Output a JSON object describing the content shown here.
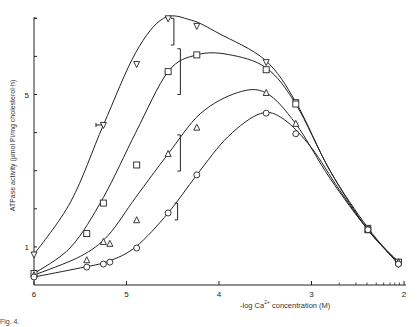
{
  "chart_data": {
    "type": "line",
    "title": "",
    "xlabel": "-log Ca2+ concentration (M)",
    "xlabel_parts": {
      "prefix": "-log Ca",
      "sup": "2+",
      "suffix": " concentration (M)"
    },
    "ylabel": "ATPase activity (µmol Pi/mg cholesterol·h)",
    "xlim": [
      6,
      2
    ],
    "ylim": [
      0,
      7.0
    ],
    "x_ticks": [
      6,
      5,
      4,
      3,
      2
    ],
    "x_tick_labels": [
      "6",
      "5",
      "4",
      "3",
      "2"
    ],
    "x_minor_ticks": [
      2.7,
      2.52,
      2.4,
      2.3,
      2.22,
      2.15,
      2.1,
      2.05
    ],
    "y_ticks": [
      1,
      2,
      3,
      4,
      5,
      6,
      7
    ],
    "y_tick_labels": {
      "1": "1",
      "5": "5"
    },
    "grid": false,
    "legend": null,
    "series": [
      {
        "name": "inverted-triangle",
        "marker": "triangle-down",
        "points": [
          [
            6.0,
            0.8
          ],
          [
            5.25,
            4.2
          ],
          [
            4.89,
            5.8
          ],
          [
            4.55,
            7.0
          ],
          [
            4.24,
            6.8
          ],
          [
            3.49,
            5.85
          ],
          [
            3.17,
            4.8
          ],
          [
            2.39,
            1.5
          ],
          [
            2.06,
            0.55
          ]
        ],
        "curve": [
          [
            6.0,
            0.8
          ],
          [
            5.6,
            2.2
          ],
          [
            5.25,
            4.2
          ],
          [
            4.9,
            6.1
          ],
          [
            4.6,
            7.0
          ],
          [
            4.3,
            6.95
          ],
          [
            4.0,
            6.6
          ],
          [
            3.5,
            5.9
          ],
          [
            3.17,
            4.8
          ],
          [
            2.8,
            3.0
          ],
          [
            2.39,
            1.5
          ],
          [
            2.06,
            0.55
          ]
        ]
      },
      {
        "name": "square",
        "marker": "square",
        "points": [
          [
            6.0,
            0.3
          ],
          [
            5.43,
            1.35
          ],
          [
            5.25,
            2.15
          ],
          [
            4.89,
            3.15
          ],
          [
            4.55,
            5.6
          ],
          [
            4.24,
            6.04
          ],
          [
            3.49,
            5.65
          ],
          [
            3.17,
            4.75
          ],
          [
            2.39,
            1.45
          ],
          [
            2.06,
            0.6
          ]
        ],
        "curve": [
          [
            6.0,
            0.3
          ],
          [
            5.6,
            1.0
          ],
          [
            5.25,
            2.3
          ],
          [
            4.9,
            4.0
          ],
          [
            4.55,
            5.6
          ],
          [
            4.24,
            6.04
          ],
          [
            3.9,
            6.05
          ],
          [
            3.49,
            5.7
          ],
          [
            3.17,
            4.75
          ],
          [
            2.8,
            3.0
          ],
          [
            2.39,
            1.45
          ],
          [
            2.06,
            0.6
          ]
        ]
      },
      {
        "name": "triangle",
        "marker": "triangle-up",
        "points": [
          [
            6.0,
            0.26
          ],
          [
            5.43,
            0.65
          ],
          [
            5.25,
            1.13
          ],
          [
            5.18,
            1.08
          ],
          [
            4.89,
            1.7
          ],
          [
            4.55,
            3.44
          ],
          [
            4.24,
            4.13
          ],
          [
            3.49,
            5.04
          ],
          [
            3.17,
            4.23
          ],
          [
            2.39,
            1.45
          ],
          [
            2.06,
            0.6
          ]
        ],
        "curve": [
          [
            6.0,
            0.26
          ],
          [
            5.5,
            0.75
          ],
          [
            5.2,
            1.3
          ],
          [
            4.9,
            2.3
          ],
          [
            4.55,
            3.44
          ],
          [
            4.2,
            4.5
          ],
          [
            3.8,
            5.05
          ],
          [
            3.49,
            5.04
          ],
          [
            3.17,
            4.23
          ],
          [
            2.8,
            2.8
          ],
          [
            2.39,
            1.45
          ],
          [
            2.06,
            0.6
          ]
        ]
      },
      {
        "name": "circle",
        "marker": "circle",
        "points": [
          [
            6.0,
            0.21
          ],
          [
            5.43,
            0.47
          ],
          [
            5.25,
            0.55
          ],
          [
            5.18,
            0.6
          ],
          [
            4.89,
            0.97
          ],
          [
            4.55,
            1.89
          ],
          [
            4.24,
            2.89
          ],
          [
            3.49,
            4.51
          ],
          [
            3.17,
            3.97
          ],
          [
            2.39,
            1.45
          ],
          [
            2.06,
            0.55
          ]
        ],
        "curve": [
          [
            6.0,
            0.21
          ],
          [
            5.5,
            0.45
          ],
          [
            5.2,
            0.62
          ],
          [
            4.9,
            1.0
          ],
          [
            4.55,
            1.89
          ],
          [
            4.24,
            2.89
          ],
          [
            3.9,
            3.9
          ],
          [
            3.55,
            4.5
          ],
          [
            3.3,
            4.35
          ],
          [
            3.0,
            3.6
          ],
          [
            2.7,
            2.5
          ],
          [
            2.39,
            1.45
          ],
          [
            2.06,
            0.55
          ]
        ]
      }
    ],
    "error_bars": [
      {
        "series": "inverted-triangle",
        "x": 5.25,
        "y": 4.2,
        "direction": "horizontal",
        "low": 5.33,
        "high": 5.25
      },
      {
        "series": "inverted-triangle",
        "x": 4.52,
        "y": 7.0,
        "direction": "vertical",
        "low": 6.3,
        "high": 7.0
      },
      {
        "series": "square",
        "x": 4.45,
        "y": 5.6,
        "direction": "vertical",
        "low": 5.0,
        "high": 6.2
      },
      {
        "series": "triangle",
        "x": 4.45,
        "y": 3.44,
        "direction": "vertical",
        "low": 2.99,
        "high": 3.94
      },
      {
        "series": "circle",
        "x": 4.48,
        "y": 1.89,
        "direction": "vertical",
        "low": 1.71,
        "high": 2.15
      }
    ]
  },
  "caption": "Fig. 4."
}
